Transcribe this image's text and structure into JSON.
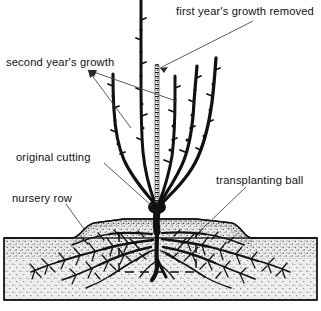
{
  "figure": {
    "width": 321,
    "height": 311,
    "background_color": "#ffffff",
    "ink_color": "#111111",
    "soil_fill_color": "#e8e8e8",
    "soil_stipple_color": "#4d4d4d",
    "mound_stipple_color": "#3a3a3a",
    "leader_line_color": "#4a4a4a"
  },
  "labels": {
    "first_year": "first year's growth removed",
    "second_year": "second year's growth",
    "original_cutting": "original cutting",
    "nursery_row": "nursery row",
    "transplanting_ball": "transplanting ball"
  },
  "parts": {
    "shoots_count": 6,
    "central_stub_label": "cut first-year leader stub",
    "root_system_label": "fibrous root system",
    "taproot_label": "taproot",
    "ball_outline_style": "dashed"
  }
}
